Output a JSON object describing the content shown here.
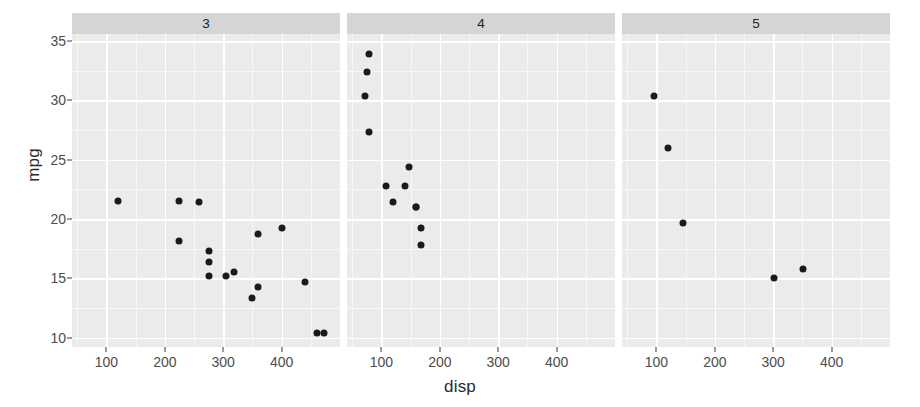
{
  "chart_data": {
    "type": "scatter",
    "title": "",
    "xlabel": "disp",
    "ylabel": "mpg",
    "xlim": [
      41,
      500
    ],
    "ylim": [
      9.2,
      35.6
    ],
    "xticks": [
      100,
      200,
      300,
      400
    ],
    "yticks": [
      10,
      15,
      20,
      25,
      30,
      35
    ],
    "x_minor_ticks": [
      50,
      150,
      250,
      350,
      450
    ],
    "y_minor_ticks": [
      12.5,
      17.5,
      22.5,
      27.5,
      32.5
    ],
    "grid": true,
    "legend": "none",
    "facet_variable": "gear",
    "facet_layout": "1 row x 3 columns",
    "point_color": "#1a1a1a",
    "panel_background": "#ebebeb",
    "strip_background": "#d5d5d5",
    "gridline_color": "#ffffff",
    "facets": [
      {
        "label": "3",
        "points": [
          {
            "x": 225.0,
            "y": 21.5
          },
          {
            "x": 258.0,
            "y": 21.4
          },
          {
            "x": 360.0,
            "y": 18.7
          },
          {
            "x": 360.0,
            "y": 14.3
          },
          {
            "x": 225.0,
            "y": 18.1
          },
          {
            "x": 275.8,
            "y": 17.3
          },
          {
            "x": 275.8,
            "y": 16.4
          },
          {
            "x": 275.8,
            "y": 15.2
          },
          {
            "x": 318.0,
            "y": 15.5
          },
          {
            "x": 304.0,
            "y": 15.2
          },
          {
            "x": 350.0,
            "y": 13.3
          },
          {
            "x": 400.0,
            "y": 19.2
          },
          {
            "x": 440.0,
            "y": 14.7
          },
          {
            "x": 460.0,
            "y": 10.4
          },
          {
            "x": 472.0,
            "y": 10.4
          },
          {
            "x": 120.1,
            "y": 21.5
          }
        ]
      },
      {
        "label": "4",
        "points": [
          {
            "x": 78.7,
            "y": 33.9
          },
          {
            "x": 75.7,
            "y": 32.4
          },
          {
            "x": 71.1,
            "y": 30.4
          },
          {
            "x": 79.0,
            "y": 27.3
          },
          {
            "x": 146.7,
            "y": 24.4
          },
          {
            "x": 140.8,
            "y": 22.8
          },
          {
            "x": 108.0,
            "y": 22.8
          },
          {
            "x": 120.3,
            "y": 21.4
          },
          {
            "x": 160.0,
            "y": 21.0
          },
          {
            "x": 160.0,
            "y": 21.0
          },
          {
            "x": 167.6,
            "y": 19.2
          },
          {
            "x": 167.6,
            "y": 17.8
          }
        ]
      },
      {
        "label": "5",
        "points": [
          {
            "x": 95.1,
            "y": 30.4
          },
          {
            "x": 120.3,
            "y": 26.0
          },
          {
            "x": 145.0,
            "y": 19.7
          },
          {
            "x": 301.0,
            "y": 15.0
          },
          {
            "x": 351.0,
            "y": 15.8
          }
        ]
      }
    ]
  },
  "axes": {
    "y_title": "mpg",
    "x_title": "disp",
    "y_tick_labels": [
      "35",
      "30",
      "25",
      "20",
      "15",
      "10"
    ],
    "x_tick_labels": [
      "100",
      "200",
      "300",
      "400"
    ]
  }
}
